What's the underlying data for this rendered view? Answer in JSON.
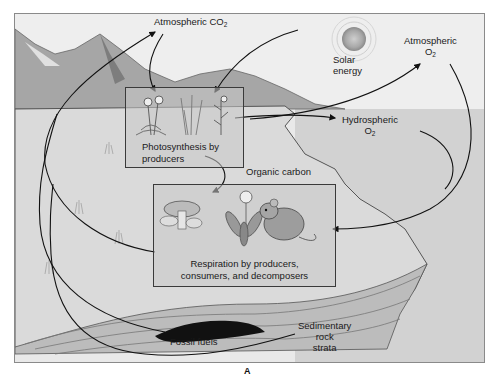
{
  "figure": {
    "caption": "A",
    "colors": {
      "sky": "#ececec",
      "land": "#d9d9d9",
      "water": "#cfcfcf",
      "mountains": "#9a9a9a",
      "rock_strata": "#b5b5b5",
      "fossil_fuel": "#111111",
      "arrow": "#111111"
    }
  },
  "labels": {
    "atm_co2_prefix": "Atmospheric CO",
    "atm_co2_sub": "2",
    "solar_line1": "Solar",
    "solar_line2": "energy",
    "atm_o2_line1": "Atmospheric",
    "atm_o2_prefix": "O",
    "atm_o2_sub": "2",
    "hydro_line1": "Hydrospheric",
    "hydro_prefix": "O",
    "hydro_sub": "2",
    "organic_carbon": "Organic carbon",
    "fossil_fuels": "Fossil fuels",
    "sediment_line1": "Sedimentary",
    "sediment_line2": "rock",
    "sediment_line3": "strata"
  },
  "boxes": {
    "photosynthesis": {
      "line1": "Photosynthesis by",
      "line2": "producers"
    },
    "respiration": {
      "line1": "Respiration by producers,",
      "line2": "consumers, and decomposers"
    }
  },
  "icons": [
    "sun-icon",
    "mountains-icon",
    "plants-icon",
    "mushroom-icon",
    "flower-icon",
    "mouse-icon",
    "fossil-fuel-deposit-icon"
  ]
}
